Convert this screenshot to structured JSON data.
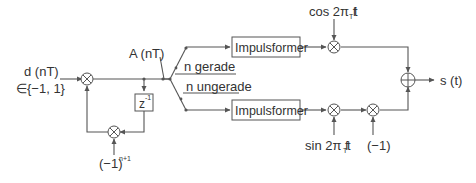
{
  "diagram": {
    "colors": {
      "line": "#555555",
      "text": "#333333",
      "background": "#ffffff"
    },
    "input": {
      "line1": "d (nT)",
      "line2": "∈{−1, 1}"
    },
    "node_A": "A (nT)",
    "switch": {
      "upper_label": "n gerade",
      "lower_label": "n ungerade"
    },
    "delay": {
      "base": "z",
      "exp": "-1"
    },
    "feedback_factor": {
      "base": "(−1)",
      "exp": "n+1"
    },
    "blocks": {
      "upper": "Impulsformer",
      "lower": "Impulsformer"
    },
    "carriers": {
      "cos": {
        "prefix": "cos 2π f",
        "sub": "T",
        "suffix": "t"
      },
      "sin": {
        "prefix": "sin 2π f",
        "sub": "T",
        "suffix": "t"
      }
    },
    "inverter": "(−1)",
    "output": "s (t)",
    "icons": {
      "multiplier": "circled-times",
      "adder": "circled-plus"
    }
  }
}
